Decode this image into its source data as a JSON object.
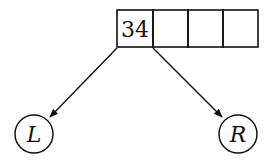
{
  "diagram": {
    "node_array": {
      "cells": [
        "34",
        "",
        "",
        ""
      ]
    },
    "children": [
      {
        "label": "L",
        "side": "left"
      },
      {
        "label": "R",
        "side": "right"
      }
    ],
    "stroke_color": "#111111",
    "background": "#ffffff"
  }
}
